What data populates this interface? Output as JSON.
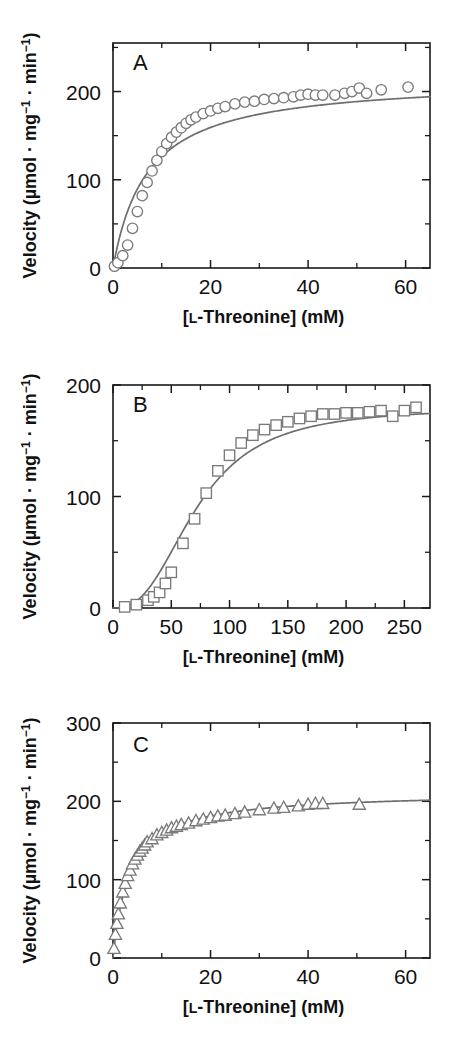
{
  "figure": {
    "background": "#ffffff",
    "marker_stroke": "#7a7a7a",
    "line_color": "#6e6e6e",
    "axis_color": "#1a1a1a"
  },
  "axis_labels": {
    "x_title_prefix": "[",
    "x_title_smallcap": "L",
    "x_title_main": "-Threonine] (mM)",
    "y_title_part1": "Velocity (µmol · mg",
    "y_title_sup1": "−1",
    "y_title_part2": " · min",
    "y_title_sup2": "−1",
    "y_title_part3": ")"
  },
  "panels": [
    {
      "id": "A",
      "letter": "A",
      "marker": "circle",
      "x_ticks": [
        "0",
        "20",
        "40",
        "60"
      ],
      "x_tick_values": [
        0,
        20,
        40,
        60
      ],
      "x_minor_values": [
        10,
        30,
        50
      ],
      "y_ticks": [
        "0",
        "100",
        "200"
      ],
      "y_tick_values": [
        0,
        100,
        200
      ],
      "y_minor_values": [
        50,
        150,
        250
      ],
      "xlim": [
        0,
        65
      ],
      "ylim": [
        0,
        255
      ]
    },
    {
      "id": "B",
      "letter": "B",
      "marker": "square",
      "x_ticks": [
        "0",
        "50",
        "100",
        "150",
        "200",
        "250"
      ],
      "x_tick_values": [
        0,
        50,
        100,
        150,
        200,
        250
      ],
      "x_minor_values": [
        25,
        75,
        125,
        175,
        225
      ],
      "y_ticks": [
        "0",
        "100",
        "200"
      ],
      "y_tick_values": [
        0,
        100,
        200
      ],
      "y_minor_values": [
        50,
        150
      ],
      "xlim": [
        0,
        272
      ],
      "ylim": [
        0,
        200
      ]
    },
    {
      "id": "C",
      "letter": "C",
      "marker": "triangle",
      "x_ticks": [
        "0",
        "20",
        "40",
        "60"
      ],
      "x_tick_values": [
        0,
        20,
        40,
        60
      ],
      "x_minor_values": [
        10,
        30,
        50
      ],
      "y_ticks": [
        "0",
        "100",
        "200",
        "300"
      ],
      "y_tick_values": [
        0,
        100,
        200,
        300
      ],
      "y_minor_values": [
        50,
        150,
        250
      ],
      "xlim": [
        0,
        65
      ],
      "ylim": [
        0,
        300
      ]
    }
  ],
  "chart_data": [
    {
      "type": "scatter",
      "panel": "A",
      "title": "A",
      "xlabel": "[L-Threonine] (mM)",
      "ylabel": "Velocity (µmol · mg⁻¹ · min⁻¹)",
      "xlim": [
        0,
        65
      ],
      "ylim": [
        0,
        255
      ],
      "grid": false,
      "legend": "none",
      "marker": "open-circle",
      "kinetics": "michaelis-menten hyperbolic",
      "x": [
        0.3,
        1.0,
        2.0,
        3.0,
        4.0,
        5.0,
        6.0,
        7.0,
        8.0,
        9.0,
        10.0,
        11.0,
        12.0,
        13.0,
        14.0,
        15.0,
        16.0,
        17.0,
        18.5,
        20.0,
        21.5,
        23.0,
        25.0,
        27.0,
        29.0,
        31.0,
        33.0,
        35.0,
        37.0,
        38.5,
        40.0,
        41.5,
        43.0,
        45.5,
        47.5,
        49.0,
        50.5,
        52.0,
        55.0,
        60.5
      ],
      "y": [
        2,
        6,
        14,
        26,
        45,
        64,
        82,
        97,
        110,
        122,
        132,
        141,
        148,
        154,
        159,
        164,
        168,
        171,
        175,
        178,
        181,
        183,
        186,
        188,
        189,
        191,
        192,
        193,
        194,
        196,
        197,
        196,
        196,
        196,
        198,
        200,
        204,
        198,
        202,
        205
      ],
      "fit_curve": {
        "model": "v = Vmax*S/(Km+S)",
        "Vmax": 215,
        "Km": 7.0
      }
    },
    {
      "type": "scatter",
      "panel": "B",
      "title": "B",
      "xlabel": "[L-Threonine] (mM)",
      "ylabel": "Velocity (µmol · mg⁻¹ · min⁻¹)",
      "xlim": [
        0,
        272
      ],
      "ylim": [
        0,
        200
      ],
      "grid": false,
      "legend": "none",
      "marker": "open-square",
      "kinetics": "sigmoidal cooperative",
      "x": [
        10,
        20,
        30,
        35,
        40,
        45,
        50,
        60,
        70,
        80,
        90,
        100,
        110,
        120,
        130,
        140,
        150,
        160,
        170,
        180,
        190,
        200,
        210,
        220,
        230,
        240,
        250,
        260
      ],
      "y": [
        1,
        3,
        7,
        10,
        14,
        22,
        32,
        58,
        80,
        103,
        123,
        137,
        148,
        155,
        160,
        164,
        167,
        170,
        172,
        174,
        174,
        175,
        175,
        176,
        177,
        172,
        177,
        180
      ],
      "fit_curve": {
        "model": "hill",
        "Vmax": 180,
        "K": 72,
        "n": 2.6
      }
    },
    {
      "type": "scatter",
      "panel": "C",
      "title": "C",
      "xlabel": "[L-Threonine] (mM)",
      "ylabel": "Velocity (µmol · mg⁻¹ · min⁻¹)",
      "xlim": [
        0,
        65
      ],
      "ylim": [
        0,
        300
      ],
      "grid": false,
      "legend": "none",
      "marker": "open-triangle",
      "kinetics": "michaelis-menten hyperbolic low Km",
      "x": [
        0.2,
        0.5,
        0.8,
        1.1,
        1.5,
        2.0,
        2.5,
        3.0,
        3.5,
        4.0,
        4.5,
        5.0,
        5.5,
        6.0,
        6.5,
        7.0,
        8.0,
        9.0,
        10.0,
        11.0,
        12.0,
        13.0,
        14.0,
        15.5,
        17.0,
        18.5,
        20.0,
        21.5,
        23.0,
        25.0,
        27.0,
        30.0,
        33.0,
        35.0,
        38.0,
        40.0,
        41.5,
        43.0,
        50.5
      ],
      "y": [
        12,
        30,
        44,
        56,
        70,
        84,
        95,
        105,
        112,
        120,
        126,
        131,
        136,
        140,
        144,
        148,
        152,
        157,
        160,
        163,
        166,
        168,
        170,
        172,
        175,
        177,
        179,
        181,
        182,
        184,
        186,
        189,
        191,
        192,
        194,
        196,
        197,
        197,
        196
      ],
      "fit_curve": {
        "model": "v = Vmax*S/(Km+S)",
        "Vmax": 212,
        "Km": 3.4
      }
    }
  ]
}
